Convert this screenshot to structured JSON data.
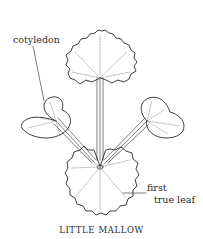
{
  "figure": {
    "title": "LITTLE MALLOW",
    "labels": {
      "cotyledon": "cotyledon",
      "first_true_leaf_line1": "first",
      "first_true_leaf_line2": "true leaf"
    },
    "colors": {
      "line": "#2a2a2a",
      "vein": "#777777",
      "background": "#ffffff"
    }
  }
}
